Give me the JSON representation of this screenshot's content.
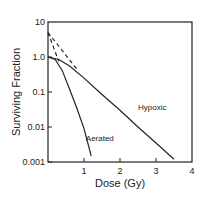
{
  "chart_data": {
    "type": "line",
    "title": "",
    "xlabel": "Dose (Gy)",
    "ylabel": "Surviving Fraction",
    "xlim": [
      0,
      4
    ],
    "ylim": [
      0.001,
      10
    ],
    "yscale": "log",
    "grid": false,
    "x_ticks": [
      "1",
      "2",
      "3",
      "4"
    ],
    "y_ticks": [
      "10",
      "1.0",
      "0.1",
      "0.01",
      "0.001"
    ],
    "y_top_label": "10",
    "series": [
      {
        "name": "Aerated",
        "style": "solid",
        "points": [
          [
            0,
            1.0
          ],
          [
            0.2,
            0.85
          ],
          [
            0.4,
            0.4
          ],
          [
            0.6,
            0.12
          ],
          [
            0.8,
            0.035
          ],
          [
            1.0,
            0.009
          ],
          [
            1.2,
            0.0015
          ]
        ]
      },
      {
        "name": "Hypoxic",
        "style": "solid",
        "points": [
          [
            0,
            1.0
          ],
          [
            0.3,
            0.85
          ],
          [
            0.6,
            0.55
          ],
          [
            1.0,
            0.25
          ],
          [
            1.5,
            0.085
          ],
          [
            2.0,
            0.03
          ],
          [
            2.5,
            0.01
          ],
          [
            3.0,
            0.0035
          ],
          [
            3.5,
            0.0012
          ]
        ]
      },
      {
        "name": "Aerated extrapolation",
        "style": "dashed",
        "points": [
          [
            0,
            5
          ],
          [
            0.3,
            0.75
          ]
        ]
      },
      {
        "name": "Hypoxic extrapolation",
        "style": "dashed",
        "points": [
          [
            0,
            5
          ],
          [
            0.8,
            0.45
          ]
        ]
      }
    ],
    "annotations": [
      {
        "text": "Aerated",
        "x": 1.05,
        "y": 0.004
      },
      {
        "text": "Hypoxic",
        "x": 2.5,
        "y": 0.03
      }
    ],
    "legend": "none (inline labels)"
  }
}
